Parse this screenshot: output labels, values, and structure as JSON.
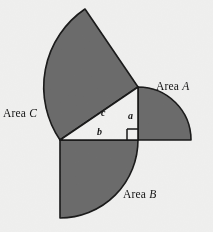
{
  "figure": {
    "background_color": "#fafaf9",
    "fill_color": "#6f6f6f",
    "stroke_color": "#1a1a1a",
    "triangle_fill": "#fbfbfa",
    "labels": {
      "area_a_prefix": "Area ",
      "area_a_letter": "A",
      "area_b_prefix": "Area ",
      "area_b_letter": "B",
      "area_c_prefix": "Area ",
      "area_c_letter": "C",
      "side_a": "a",
      "side_b": "b",
      "side_c": "c"
    }
  },
  "chart_data": {
    "type": "diagram",
    "geometry": {
      "units": "pixels",
      "triangle": {
        "vertices": {
          "apex_top_right": [
            138,
            87
          ],
          "right_angle_bottom_right": [
            138,
            140
          ],
          "bottom_left": [
            60,
            140
          ]
        },
        "right_angle_at": "right_angle_bottom_right",
        "right_angle_marker": {
          "x": 127,
          "y": 129,
          "size": 11
        },
        "sides": {
          "a": {
            "label": "a",
            "from": [
              138,
              87
            ],
            "to": [
              138,
              140
            ],
            "length": 53
          },
          "b": {
            "label": "b",
            "from": [
              60,
              140
            ],
            "to": [
              138,
              140
            ],
            "length": 78
          },
          "c": {
            "label": "c",
            "from": [
              60,
              140
            ],
            "to": [
              138,
              87
            ],
            "length": 94.3
          }
        }
      },
      "sectors": [
        {
          "name": "Area A",
          "on_side": "a",
          "center": [
            138,
            140
          ],
          "radius": 53,
          "start_angle_deg": -90,
          "end_angle_deg": 0,
          "label_position": [
            156,
            80
          ]
        },
        {
          "name": "Area B",
          "on_side": "b",
          "center": [
            60,
            140
          ],
          "radius": 78,
          "start_angle_deg": 0,
          "end_angle_deg": 90,
          "label_position": [
            123,
            188
          ]
        },
        {
          "name": "Area C",
          "on_side": "c",
          "center": [
            138,
            87
          ],
          "radius": 94.3,
          "start_angle_deg": 145.8,
          "end_angle_deg": 235.8,
          "label_position": [
            3,
            107
          ]
        }
      ]
    },
    "relation": "Area A + Area B = Area C"
  }
}
